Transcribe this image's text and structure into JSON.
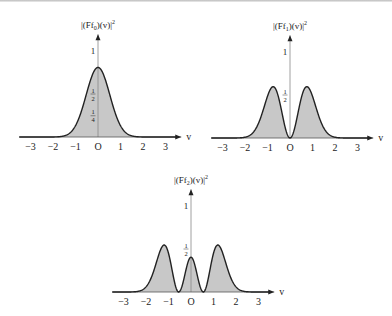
{
  "chart_data": [
    {
      "type": "area",
      "title": "|(Ff_0)(v)|^2",
      "ylabel_main": "|(Ff",
      "ylabel_sub": "0",
      "ylabel_rest": ")(v)|",
      "ylabel_sup": "2",
      "xlabel": "v",
      "x_ticks": [
        "−3",
        "−2",
        "−1",
        "O",
        "1",
        "2",
        "3"
      ],
      "x_tick_values": [
        -3,
        -2,
        -1,
        0,
        1,
        2,
        3
      ],
      "y_tick_labels": [
        {
          "num": "1",
          "den": "",
          "value": 1
        },
        {
          "num": "1",
          "den": "2",
          "value": 0.5
        },
        {
          "num": "1",
          "den": "4",
          "value": 0.25
        }
      ],
      "xlim": [
        -3.5,
        3.5
      ],
      "peak_value": 0.8,
      "shape": "gaussian",
      "params": {
        "a": 0.55,
        "c": 0.8
      },
      "origin_px": [
        98,
        137
      ],
      "x_unit_px": 22.5,
      "y_unit_px": 87
    },
    {
      "type": "area",
      "title": "|(Ff_1)(v)|^2",
      "ylabel_main": "|(Ff",
      "ylabel_sub": "1",
      "ylabel_rest": ")(v)|",
      "ylabel_sup": "2",
      "xlabel": "v",
      "x_ticks": [
        "−3",
        "−2",
        "−1",
        "O",
        "1",
        "2",
        "3"
      ],
      "x_tick_values": [
        -3,
        -2,
        -1,
        0,
        1,
        2,
        3
      ],
      "y_tick_labels": [
        {
          "num": "1",
          "den": "",
          "value": 1
        },
        {
          "num": "1",
          "den": "2",
          "value": 0.5
        }
      ],
      "xlim": [
        -3.5,
        3.5
      ],
      "peak_value": 0.59,
      "peak_positions": [
        -0.75,
        0.75
      ],
      "shape": "hermite1",
      "params": {
        "a": 0.56,
        "c": 0.59
      },
      "origin_px": [
        290,
        138
      ],
      "x_unit_px": 22.5,
      "y_unit_px": 87
    },
    {
      "type": "area",
      "title": "|(Ff_2)(v)|^2",
      "ylabel_main": "|(Ff",
      "ylabel_sub": "2",
      "ylabel_rest": ")(v)|",
      "ylabel_sup": "2",
      "xlabel": "v",
      "x_ticks": [
        "−3",
        "−2",
        "−1",
        "O",
        "1",
        "2",
        "3"
      ],
      "x_tick_values": [
        -3,
        -2,
        -1,
        0,
        1,
        2,
        3
      ],
      "y_tick_labels": [
        {
          "num": "1",
          "den": "",
          "value": 1
        },
        {
          "num": "1",
          "den": "2",
          "value": 0.5
        }
      ],
      "xlim": [
        -3.5,
        3.5
      ],
      "peak_value": 0.54,
      "center_value": 0.4,
      "peak_positions": [
        -1.15,
        0,
        1.15
      ],
      "shape": "hermite2",
      "params": {
        "a": 0.56,
        "k": 0.56,
        "c": 0.54,
        "center": 0.4
      },
      "origin_px": [
        191,
        292
      ],
      "x_unit_px": 22.5,
      "y_unit_px": 87
    }
  ]
}
